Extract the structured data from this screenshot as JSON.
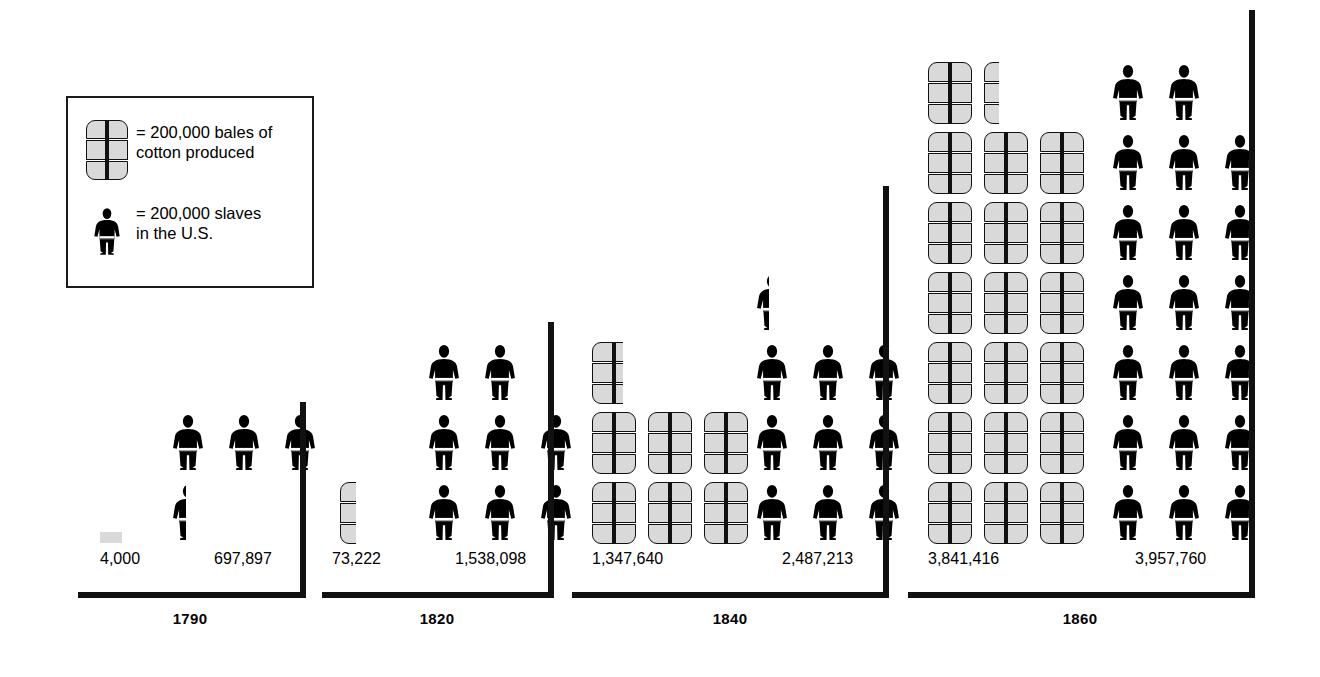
{
  "legend": {
    "bale_symbol_name": "cotton-bale-icon",
    "bale_text": "= 200,000 bales of\ncotton produced",
    "person_symbol_name": "slave-figure-icon",
    "person_text": "= 200,000 slaves\nin the U.S."
  },
  "colors": {
    "bale_fill": "#d9d9d9",
    "outline": "#111111",
    "person_fill": "#000000",
    "background": "#ffffff"
  },
  "chart_data": {
    "type": "pictogram",
    "title": "",
    "unit_value": 200000,
    "unit_labels": {
      "cotton": "200,000 bales of cotton produced",
      "slaves": "200,000 slaves in the U.S."
    },
    "categories": [
      "1790",
      "1820",
      "1840",
      "1860"
    ],
    "series": [
      {
        "name": "Bales of cotton produced",
        "symbol": "cotton-bale-icon",
        "values": [
          4000,
          73222,
          1347640,
          3841416
        ],
        "value_labels": [
          "4,000",
          "73,222",
          "1,347,640",
          "3,841,416"
        ],
        "icon_units": [
          0.02,
          0.37,
          6.74,
          19.21
        ]
      },
      {
        "name": "Slaves in the U.S.",
        "symbol": "slave-figure-icon",
        "values": [
          697897,
          1538098,
          2487213,
          3957760
        ],
        "value_labels": [
          "697,897",
          "1,538,098",
          "2,487,213",
          "3,957,760"
        ],
        "icon_units": [
          3.49,
          7.69,
          12.44,
          19.79
        ]
      }
    ],
    "legend": [
      "200,000 bales of cotton produced",
      "200,000 slaves in the U.S."
    ],
    "legend_position": "top-left",
    "grid": false
  },
  "panels": [
    {
      "year": "1790",
      "cotton_label": "4,000",
      "slaves_label": "697,897",
      "cotton_icons": [
        {
          "row": 0,
          "col": 0,
          "frac": 0.02
        }
      ],
      "slave_icons": [
        {
          "row": 0,
          "col": 0,
          "frac": 0.45
        },
        {
          "row": 1,
          "col": 0,
          "frac": 1
        },
        {
          "row": 1,
          "col": 1,
          "frac": 1
        },
        {
          "row": 1,
          "col": 2,
          "frac": 1
        }
      ]
    },
    {
      "year": "1820",
      "cotton_label": "73,222",
      "slaves_label": "1,538,098",
      "cotton_icons": [
        {
          "row": 0,
          "col": 0,
          "frac": 0.37
        }
      ],
      "slave_icons": [
        {
          "row": 2,
          "col": 0,
          "frac": 1
        },
        {
          "row": 2,
          "col": 1,
          "frac": 1
        },
        {
          "row": 1,
          "col": 0,
          "frac": 1
        },
        {
          "row": 1,
          "col": 1,
          "frac": 1
        },
        {
          "row": 1,
          "col": 2,
          "frac": 1
        },
        {
          "row": 0,
          "col": 0,
          "frac": 1
        },
        {
          "row": 0,
          "col": 1,
          "frac": 1
        },
        {
          "row": 0,
          "col": 2,
          "frac": 1
        }
      ]
    },
    {
      "year": "1840",
      "cotton_label": "1,347,640",
      "slaves_label": "2,487,213",
      "cotton_icons": [
        {
          "row": 2,
          "col": 0,
          "frac": 0.7
        },
        {
          "row": 1,
          "col": 0,
          "frac": 1
        },
        {
          "row": 1,
          "col": 1,
          "frac": 1
        },
        {
          "row": 1,
          "col": 2,
          "frac": 1
        },
        {
          "row": 0,
          "col": 0,
          "frac": 1
        },
        {
          "row": 0,
          "col": 1,
          "frac": 1
        },
        {
          "row": 0,
          "col": 2,
          "frac": 1
        }
      ],
      "slave_icons": [
        {
          "row": 3,
          "col": 0,
          "frac": 0.42
        },
        {
          "row": 2,
          "col": 0,
          "frac": 1
        },
        {
          "row": 2,
          "col": 1,
          "frac": 1
        },
        {
          "row": 2,
          "col": 2,
          "frac": 1
        },
        {
          "row": 1,
          "col": 0,
          "frac": 1
        },
        {
          "row": 1,
          "col": 1,
          "frac": 1
        },
        {
          "row": 1,
          "col": 2,
          "frac": 1
        },
        {
          "row": 0,
          "col": 0,
          "frac": 1
        },
        {
          "row": 0,
          "col": 1,
          "frac": 1
        },
        {
          "row": 0,
          "col": 2,
          "frac": 1
        }
      ]
    },
    {
      "year": "1860",
      "cotton_label": "3,841,416",
      "slaves_label": "3,957,760",
      "cotton_icons": [
        {
          "row": 6,
          "col": 0,
          "frac": 1
        },
        {
          "row": 6,
          "col": 1,
          "frac": 0.35
        },
        {
          "row": 5,
          "col": 0,
          "frac": 1
        },
        {
          "row": 5,
          "col": 1,
          "frac": 1
        },
        {
          "row": 5,
          "col": 2,
          "frac": 1
        },
        {
          "row": 4,
          "col": 0,
          "frac": 1
        },
        {
          "row": 4,
          "col": 1,
          "frac": 1
        },
        {
          "row": 4,
          "col": 2,
          "frac": 1
        },
        {
          "row": 3,
          "col": 0,
          "frac": 1
        },
        {
          "row": 3,
          "col": 1,
          "frac": 1
        },
        {
          "row": 3,
          "col": 2,
          "frac": 1
        },
        {
          "row": 2,
          "col": 0,
          "frac": 1
        },
        {
          "row": 2,
          "col": 1,
          "frac": 1
        },
        {
          "row": 2,
          "col": 2,
          "frac": 1
        },
        {
          "row": 1,
          "col": 0,
          "frac": 1
        },
        {
          "row": 1,
          "col": 1,
          "frac": 1
        },
        {
          "row": 1,
          "col": 2,
          "frac": 1
        },
        {
          "row": 0,
          "col": 0,
          "frac": 1
        },
        {
          "row": 0,
          "col": 1,
          "frac": 1
        },
        {
          "row": 0,
          "col": 2,
          "frac": 1
        }
      ],
      "slave_icons": [
        {
          "row": 6,
          "col": 0,
          "frac": 1
        },
        {
          "row": 6,
          "col": 1,
          "frac": 1
        },
        {
          "row": 5,
          "col": 0,
          "frac": 1
        },
        {
          "row": 5,
          "col": 1,
          "frac": 1
        },
        {
          "row": 5,
          "col": 2,
          "frac": 1
        },
        {
          "row": 4,
          "col": 0,
          "frac": 1
        },
        {
          "row": 4,
          "col": 1,
          "frac": 1
        },
        {
          "row": 4,
          "col": 2,
          "frac": 1
        },
        {
          "row": 3,
          "col": 0,
          "frac": 1
        },
        {
          "row": 3,
          "col": 1,
          "frac": 1
        },
        {
          "row": 3,
          "col": 2,
          "frac": 1
        },
        {
          "row": 2,
          "col": 0,
          "frac": 1
        },
        {
          "row": 2,
          "col": 1,
          "frac": 1
        },
        {
          "row": 2,
          "col": 2,
          "frac": 1
        },
        {
          "row": 1,
          "col": 0,
          "frac": 1
        },
        {
          "row": 1,
          "col": 1,
          "frac": 1
        },
        {
          "row": 1,
          "col": 2,
          "frac": 1
        },
        {
          "row": 0,
          "col": 0,
          "frac": 1
        },
        {
          "row": 0,
          "col": 1,
          "frac": 1
        },
        {
          "row": 0,
          "col": 2,
          "frac": 1
        }
      ]
    }
  ],
  "layout": {
    "panel_geometry": [
      {
        "left": 78,
        "axis_right": 305,
        "axis_top": 402,
        "baseline": 592,
        "cotton_x": 100,
        "slave_x": 168,
        "num_cotton_x": 100,
        "num_slave_x": 214,
        "year_x": 190
      },
      {
        "left": 322,
        "axis_right": 553,
        "axis_top": 322,
        "baseline": 592,
        "cotton_x": 340,
        "slave_x": 424,
        "num_cotton_x": 332,
        "num_slave_x": 455,
        "year_x": 437
      },
      {
        "left": 572,
        "axis_right": 888,
        "axis_top": 186,
        "baseline": 592,
        "cotton_x": 592,
        "slave_x": 752,
        "num_cotton_x": 592,
        "num_slave_x": 782,
        "year_x": 730
      },
      {
        "left": 908,
        "axis_right": 1254,
        "axis_top": 10,
        "baseline": 592,
        "cotton_x": 928,
        "slave_x": 1108,
        "num_cotton_x": 928,
        "num_slave_x": 1135,
        "year_x": 1080
      }
    ],
    "cell_w": 56,
    "cell_h": 70,
    "icon_w": 44,
    "icon_h": 62
  }
}
